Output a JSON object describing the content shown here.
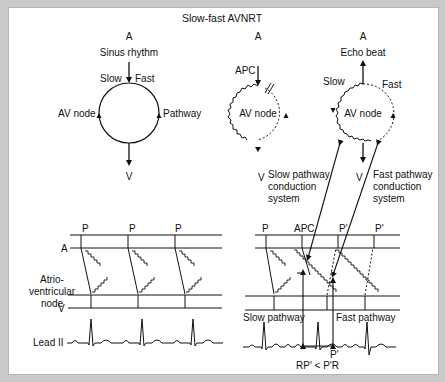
{
  "title": "Slow-fast AVNRT",
  "panel1": {
    "top_label": "A",
    "sinus": "Sinus rhythm",
    "slow": "Slow",
    "fast": "Fast",
    "av_node": "AV node",
    "pathway": "Pathway",
    "bottom_label": "V"
  },
  "panel2": {
    "top_label": "A",
    "apc": "APC",
    "av_node": "AV node",
    "bottom_label": "V"
  },
  "panel3": {
    "top_label": "A",
    "echo": "Echo beat",
    "slow": "Slow",
    "fast": "Fast",
    "av_node": "AV node",
    "bottom_label": "V"
  },
  "callouts": {
    "slow_line1": "Slow pathway",
    "slow_line2": "conduction",
    "slow_line3": "system",
    "fast_line1": "Fast pathway",
    "fast_line2": "conduction",
    "fast_line3": "system"
  },
  "ladder_left": {
    "p_labels": [
      "P",
      "P",
      "P"
    ],
    "a_label": "A",
    "node_line1": "Atrio-",
    "node_line2": "ventricular",
    "node_line3": "node",
    "v_label": "V",
    "lead_label": "Lead II"
  },
  "ladder_right": {
    "p_labels": [
      "P",
      "APC",
      "P'",
      "P'"
    ],
    "slow_pathway": "Slow pathway",
    "fast_pathway": "Fast pathway",
    "p_prime": "P'",
    "relation": "RP' < P'R"
  }
}
